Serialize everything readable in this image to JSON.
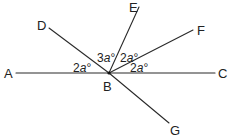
{
  "diagram": {
    "type": "geometry-angles",
    "vertex": {
      "label": "B",
      "x": 109,
      "y": 73
    },
    "points": [
      {
        "label": "A",
        "x": 16,
        "y": 73,
        "label_x": 4,
        "label_y": 78
      },
      {
        "label": "C",
        "x": 215,
        "y": 73,
        "label_x": 218,
        "label_y": 78
      },
      {
        "label": "D",
        "x": 49,
        "y": 28,
        "label_x": 37,
        "label_y": 30
      },
      {
        "label": "E",
        "x": 139,
        "y": 7,
        "label_x": 129,
        "label_y": 12
      },
      {
        "label": "F",
        "x": 193,
        "y": 30,
        "label_x": 197,
        "label_y": 35
      },
      {
        "label": "G",
        "x": 169,
        "y": 123,
        "label_x": 170,
        "label_y": 135
      }
    ],
    "angles": [
      {
        "between": "A-B-D",
        "coef": "2",
        "var": "a",
        "unit": "°",
        "x": 73,
        "y": 72
      },
      {
        "between": "D-B-E",
        "coef": "3",
        "var": "a",
        "unit": "°",
        "x": 97,
        "y": 62
      },
      {
        "between": "E-B-F",
        "coef": "2",
        "var": "a",
        "unit": "°",
        "x": 120,
        "y": 62
      },
      {
        "between": "F-B-C",
        "coef": "2",
        "var": "a",
        "unit": "°",
        "x": 130,
        "y": 72
      }
    ],
    "vertex_label_pos": {
      "x": 103,
      "y": 91
    }
  }
}
